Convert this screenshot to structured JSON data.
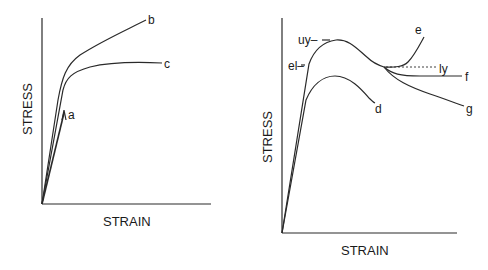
{
  "left_chart": {
    "ylabel": "STRESS",
    "xlabel": "STRAIN",
    "curves": {
      "a": "a",
      "b": "b",
      "c": "c"
    }
  },
  "right_chart": {
    "ylabel": "STRESS",
    "xlabel": "STRAIN",
    "markers": {
      "uy": "uy–",
      "el": "el–",
      "ly": "ly"
    },
    "curves": {
      "d": "d",
      "e": "e",
      "f": "f",
      "g": "g"
    }
  },
  "colors": {
    "line": "#2a2a2a",
    "text": "#1a1a1a",
    "background": "#ffffff"
  }
}
